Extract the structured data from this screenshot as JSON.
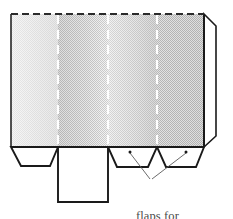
{
  "figure": {
    "name": "box-net-diagram",
    "background_color": "#ffffff",
    "outline_color": "#1a1a1a",
    "fold_line_color": "#ffffff",
    "fold_line_dark_color": "#2b2b2b",
    "annotation_color": "#4a4a4a"
  },
  "annotation": {
    "label_lines": [
      "flaps for",
      "glue"
    ],
    "line1": "flaps for",
    "line2": "glue",
    "leader_target_left": "glue-flap-third",
    "leader_target_right": "glue-flap-fourth"
  },
  "panels": [
    {
      "id": "panel-1",
      "shade": "light",
      "x": 11,
      "width": 47,
      "fill_start": "#f2f2f2",
      "fill_end": "#e2e2e2"
    },
    {
      "id": "panel-2",
      "shade": "dark",
      "x": 58,
      "width": 50,
      "fill_start": "#c8c8c8",
      "fill_end": "#e6e6e6"
    },
    {
      "id": "panel-3",
      "shade": "light",
      "x": 108,
      "width": 49,
      "fill_start": "#e9e9e9",
      "fill_end": "#cfcfcf"
    },
    {
      "id": "panel-4",
      "shade": "dark",
      "x": 157,
      "width": 47,
      "fill_start": "#cdcdcd",
      "fill_end": "#c4c4c4"
    }
  ],
  "geometry": {
    "top_y": 14,
    "bottom_y": 147,
    "left_x": 11,
    "right_x": 204,
    "fold_x": [
      58,
      108,
      157
    ],
    "side_flap_right_x": 216,
    "chamfer": 12,
    "bottom_flap_y": 166,
    "center_flap_bottom_y": 202
  },
  "dots": [
    {
      "id": "dot-left-flap",
      "cx": 130,
      "cy": 152
    },
    {
      "id": "dot-right-flap",
      "cx": 186,
      "cy": 152
    }
  ]
}
